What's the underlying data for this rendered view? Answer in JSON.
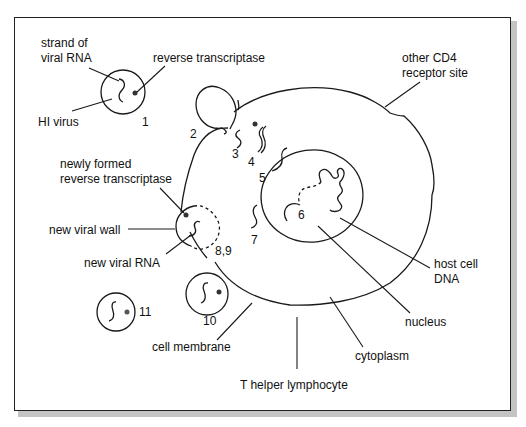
{
  "diagram": {
    "colors": {
      "line": "#1a1a1a",
      "text": "#111111",
      "background": "#ffffff",
      "shadow": "#c4c4c4"
    },
    "labels": {
      "strand_line1": "strand of",
      "strand_line2": "viral RNA",
      "reverse_transcriptase": "reverse transcriptase",
      "hi_virus": "HI virus",
      "other_cd4_line1": "other CD4",
      "other_cd4_line2": "receptor site",
      "newly_formed_line1": "newly formed",
      "newly_formed_line2": "reverse transcriptase",
      "new_viral_wall": "new viral wall",
      "new_viral_rna": "new viral RNA",
      "host_cell_dna_line1": "host cell",
      "host_cell_dna_line2": "DNA",
      "nucleus": "nucleus",
      "cytoplasm": "cytoplasm",
      "cell_membrane": "cell membrane",
      "t_helper": "T helper lymphocyte"
    },
    "stages": [
      "1",
      "2",
      "3",
      "4",
      "5",
      "6",
      "7",
      "8,9",
      "10",
      "11"
    ]
  }
}
